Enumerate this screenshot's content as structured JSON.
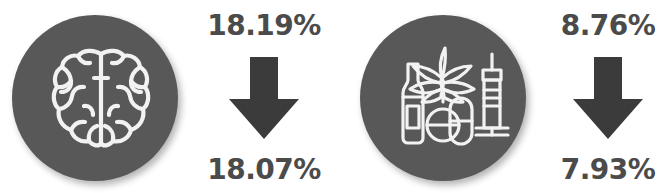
{
  "infographic": {
    "colors": {
      "badge_fill": "#585858",
      "icon_stroke": "#f2f2f2",
      "text": "#4b4b4b",
      "arrow": "#3b3b3b",
      "background": "#ffffff"
    },
    "metrics": [
      {
        "id": "mental-illness",
        "icon_name": "brain-icon",
        "arrow_name": "arrow-down-icon",
        "value_before": "18.19%",
        "value_after": "18.07%",
        "direction": "down"
      },
      {
        "id": "substance-use",
        "icon_name": "substance-use-icon",
        "arrow_name": "arrow-down-icon",
        "value_before": "8.76%",
        "value_after": "7.93%",
        "direction": "down"
      }
    ]
  }
}
